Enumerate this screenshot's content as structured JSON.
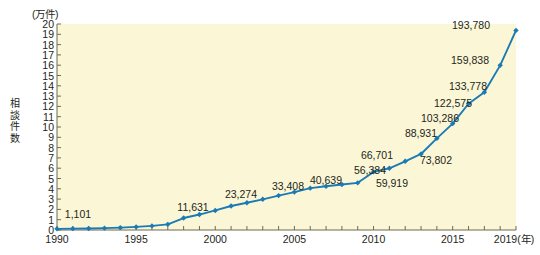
{
  "chart_data": {
    "type": "line",
    "title": "",
    "unit_note": "(万件)",
    "ylabel": "相談件数",
    "xlabel": "(年)",
    "x": [
      1990,
      1991,
      1992,
      1993,
      1994,
      1995,
      1996,
      1997,
      1998,
      1999,
      2000,
      2001,
      2002,
      2003,
      2004,
      2005,
      2006,
      2007,
      2008,
      2009,
      2010,
      2011,
      2012,
      2013,
      2014,
      2015,
      2016,
      2017,
      2018,
      2019
    ],
    "values": [
      1101,
      1300,
      1500,
      1800,
      2300,
      3000,
      4000,
      5500,
      11631,
      15000,
      19000,
      23274,
      26500,
      29800,
      33408,
      36800,
      40639,
      42500,
      44200,
      45800,
      56384,
      59919,
      66701,
      73802,
      88931,
      103286,
      122575,
      133778,
      159838,
      193780
    ],
    "ylim": [
      0,
      20
    ],
    "yticks": [
      0,
      1,
      2,
      3,
      4,
      5,
      6,
      7,
      8,
      9,
      10,
      11,
      12,
      13,
      14,
      15,
      16,
      17,
      18,
      19,
      20
    ],
    "ytick_labels": [
      "0",
      "1",
      "2",
      "3",
      "4",
      "5",
      "6",
      "7",
      "8",
      "9",
      "10",
      "11",
      "12",
      "13",
      "14",
      "15",
      "16",
      "17",
      "18",
      "19",
      "20"
    ],
    "xlim": [
      1990,
      2019
    ],
    "xtick_labels": [
      "1990",
      "1995",
      "2000",
      "2005",
      "2010",
      "2015",
      "2019"
    ],
    "xtick_values": [
      1990,
      1995,
      2000,
      2005,
      2010,
      2015,
      2019
    ],
    "xtick_minor_step": 1,
    "grid": false,
    "legend": "none",
    "y_scale_factor": 10000,
    "y_scale_note": "y axis units are 万 (10,000); plotted values are raw counts divided by 10000",
    "line_color": "#1b7ab5",
    "marker_color": "#1b7ab5",
    "marker_shape": "diamond",
    "plot_background": "#fbf7d6",
    "annotations": [
      {
        "year": 1990,
        "value": 1101,
        "label": "1,101",
        "lx": 78,
        "ly": 214
      },
      {
        "year": 1998,
        "value": 11631,
        "label": "11,631",
        "lx": 193,
        "ly": 207
      },
      {
        "year": 2001,
        "value": 23274,
        "label": "23,274",
        "lx": 241,
        "ly": 194
      },
      {
        "year": 2004,
        "value": 33408,
        "label": "33,408",
        "lx": 288,
        "ly": 186
      },
      {
        "year": 2006,
        "value": 40639,
        "label": "40,639",
        "lx": 326,
        "ly": 180
      },
      {
        "year": 2010,
        "value": 56384,
        "label": "56,384",
        "lx": 370,
        "ly": 170
      },
      {
        "year": 2011,
        "value": 59919,
        "label": "59,919",
        "lx": 392,
        "ly": 183
      },
      {
        "year": 2012,
        "value": 66701,
        "label": "66,701",
        "lx": 377,
        "ly": 155
      },
      {
        "year": 2013,
        "value": 73802,
        "label": "73,802",
        "lx": 436,
        "ly": 160
      },
      {
        "year": 2014,
        "value": 88931,
        "label": "88,931",
        "lx": 421,
        "ly": 133
      },
      {
        "year": 2015,
        "value": 103286,
        "label": "103,286",
        "lx": 440,
        "ly": 118
      },
      {
        "year": 2016,
        "value": 122575,
        "label": "122,575",
        "lx": 453,
        "ly": 103
      },
      {
        "year": 2017,
        "value": 133778,
        "label": "133,778",
        "lx": 468,
        "ly": 86
      },
      {
        "year": 2018,
        "value": 159838,
        "label": "159,838",
        "lx": 470,
        "ly": 60
      },
      {
        "year": 2019,
        "value": 193780,
        "label": "193,780",
        "lx": 471,
        "ly": 25
      }
    ]
  },
  "layout": {
    "plot_left": 57,
    "plot_right": 516,
    "plot_top": 24,
    "plot_bottom": 230
  }
}
